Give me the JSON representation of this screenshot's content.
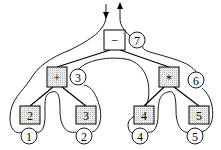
{
  "diagram": {
    "type": "expression-tree-traversal",
    "nodes": [
      {
        "id": "minus",
        "label": "−",
        "order": "7",
        "kind": "operator"
      },
      {
        "id": "plus",
        "label": "+",
        "order": "3",
        "kind": "operator"
      },
      {
        "id": "times",
        "label": "*",
        "order": "6",
        "kind": "operator"
      },
      {
        "id": "leaf2",
        "label": "2",
        "order": "1",
        "kind": "operand"
      },
      {
        "id": "leaf3",
        "label": "3",
        "order": "2",
        "kind": "operand"
      },
      {
        "id": "leaf4",
        "label": "4",
        "order": "4",
        "kind": "operand"
      },
      {
        "id": "leaf5",
        "label": "5",
        "order": "5",
        "kind": "operand"
      }
    ],
    "edges": [
      [
        "minus",
        "plus"
      ],
      [
        "minus",
        "times"
      ],
      [
        "plus",
        "leaf2"
      ],
      [
        "plus",
        "leaf3"
      ],
      [
        "times",
        "leaf4"
      ],
      [
        "times",
        "leaf5"
      ]
    ],
    "arrows": [
      "down-arrow",
      "up-arrow"
    ],
    "colors": {
      "box_fill": "#e6e6e6",
      "stroke": "#000000"
    }
  }
}
